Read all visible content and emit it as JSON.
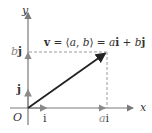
{
  "diagram": {
    "title_equation": {
      "v": "v",
      "eq1": " = ⟨",
      "a": "a",
      "comma": ", ",
      "b": "b",
      "eq2": "⟩ = ",
      "a2": "a",
      "i": "i",
      "plus": " + ",
      "b2": "b",
      "j": "j"
    },
    "axes": {
      "x_label": "x",
      "y_label": "y",
      "origin_label": "O"
    },
    "markers": {
      "bj": {
        "coef": "b",
        "unit": "j"
      },
      "ai": {
        "coef": "a",
        "unit": "i"
      },
      "unit_i": "i",
      "unit_j": "j"
    },
    "colors": {
      "axis": "#7a7a7a",
      "vector": "#222222",
      "unit": "#8a8a8a",
      "dash": "#9a9a9a"
    }
  }
}
